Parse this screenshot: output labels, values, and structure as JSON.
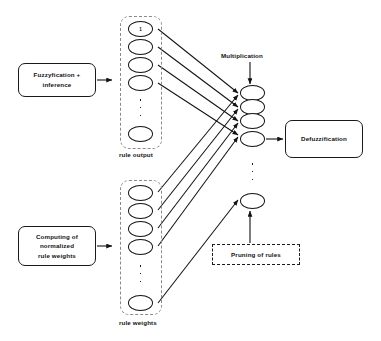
{
  "diagram": {
    "colors": {
      "stroke": "#121212",
      "frame_dash": "#8a8a8a",
      "background": "#ffffff"
    }
  },
  "boxes": {
    "fuzzyfication": {
      "label": "Fuzzyfication +\ninference",
      "line1": "Fuzzyfication +",
      "line2": "inference"
    },
    "computing": {
      "label": "Computing of normalized rule weights",
      "line1": "Computing of",
      "line2": "normalized",
      "line3": "rule weights"
    },
    "defuzzification": {
      "label": "Defuzzification"
    },
    "pruning": {
      "label": "Pruning of rules"
    }
  },
  "captions": {
    "multiplication": "Multiplication",
    "rule_output": "rule output",
    "rule_weights": "rule weights"
  },
  "layers": {
    "rule_output": {
      "name": "rule output",
      "nodes": [
        {
          "label": "1"
        },
        {
          "label": ""
        },
        {
          "label": ""
        },
        {
          "label": ""
        },
        {
          "label": ""
        }
      ],
      "ellipsis": "vertical-dots"
    },
    "rule_weights": {
      "name": "rule weights",
      "nodes": [
        {
          "label": ""
        },
        {
          "label": ""
        },
        {
          "label": ""
        },
        {
          "label": ""
        },
        {
          "label": ""
        }
      ],
      "ellipsis": "vertical-dots"
    },
    "multiplication": {
      "name": "multiplication",
      "nodes": [
        {
          "label": ""
        },
        {
          "label": ""
        },
        {
          "label": ""
        },
        {
          "label": ""
        },
        {
          "label": ""
        }
      ],
      "ellipsis": "vertical-dots"
    }
  }
}
